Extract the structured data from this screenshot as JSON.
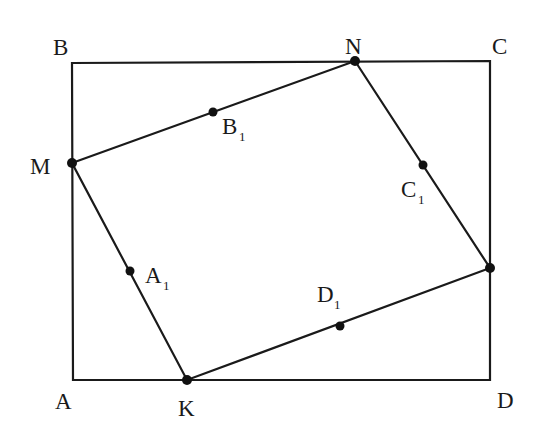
{
  "diagram": {
    "type": "geometry",
    "colors": {
      "stroke": "#1a1a1a",
      "background": "#ffffff"
    },
    "rectangle": {
      "vertices": [
        "A",
        "B",
        "C",
        "D"
      ],
      "coords": {
        "A": [
          73,
          380
        ],
        "B": [
          72,
          63
        ],
        "C": [
          490,
          61
        ],
        "D": [
          490,
          380
        ]
      }
    },
    "inner_quadrilateral": {
      "vertices": [
        "M",
        "N",
        "P",
        "K"
      ],
      "coords": {
        "M": [
          72,
          163
        ],
        "N": [
          355,
          61
        ],
        "P": [
          490,
          268
        ],
        "K": [
          187,
          380
        ]
      }
    },
    "midpoints": {
      "A1": [
        130,
        271
      ],
      "B1": [
        213,
        112
      ],
      "C1": [
        423,
        165
      ],
      "D1": [
        340,
        326
      ]
    },
    "labels": {
      "A": {
        "text": "A",
        "x": 55,
        "y": 409
      },
      "B": {
        "text": "B",
        "x": 53,
        "y": 55
      },
      "C": {
        "text": "C",
        "x": 492,
        "y": 54
      },
      "D": {
        "text": "D",
        "x": 497,
        "y": 408
      },
      "M": {
        "text": "M",
        "x": 30,
        "y": 174
      },
      "N": {
        "text": "N",
        "x": 345,
        "y": 54
      },
      "K": {
        "text": "K",
        "x": 178,
        "y": 416
      },
      "A1": {
        "text": "A",
        "sub": "1",
        "x": 145,
        "y": 283
      },
      "B1": {
        "text": "B",
        "sub": "1",
        "x": 222,
        "y": 134
      },
      "C1": {
        "text": "C",
        "sub": "1",
        "x": 401,
        "y": 197
      },
      "D1": {
        "text": "D",
        "sub": "1",
        "x": 317,
        "y": 302
      }
    }
  }
}
